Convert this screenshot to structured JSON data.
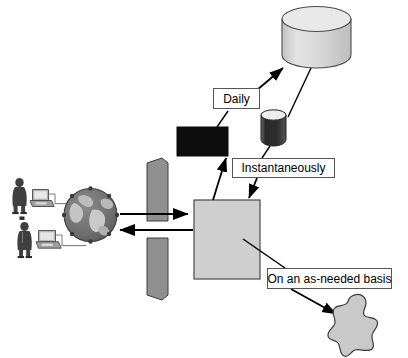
{
  "diagram": {
    "type": "flow-diagram",
    "background_color": "#ffffff",
    "labels": {
      "daily": "Daily",
      "instantaneously": "Instantaneously",
      "as_needed": "On an as-needed basis"
    },
    "nodes": [
      {
        "id": "user-top",
        "name": "user-person-top",
        "icon": "person-icon",
        "color": "#4a4a4a"
      },
      {
        "id": "workstation-top",
        "name": "workstation-top",
        "icon": "computer-icon",
        "color": "#9a9a9a"
      },
      {
        "id": "user-bottom",
        "name": "user-person-bottom",
        "icon": "person-icon",
        "color": "#4a4a4a"
      },
      {
        "id": "workstation-bottom",
        "name": "workstation-bottom",
        "icon": "computer-icon",
        "color": "#9a9a9a"
      },
      {
        "id": "globe",
        "name": "globe-internet",
        "icon": "globe-icon",
        "color": "#6e6e6e"
      },
      {
        "id": "firewall-top",
        "name": "firewall-barrier-top",
        "icon": "torn-paper-icon",
        "color": "#8c8c8c"
      },
      {
        "id": "firewall-bottom",
        "name": "firewall-barrier-bottom",
        "icon": "torn-paper-icon",
        "color": "#8c8c8c"
      },
      {
        "id": "server",
        "name": "server-square",
        "icon": "square-icon",
        "color": "#cccccc"
      },
      {
        "id": "black-box",
        "name": "black-rectangle-node",
        "icon": "rectangle-icon",
        "color": "#111111"
      },
      {
        "id": "warehouse",
        "name": "data-warehouse-cylinder",
        "icon": "database-cylinder-icon",
        "color": "#d2d2d2"
      },
      {
        "id": "small-db",
        "name": "small-database-cylinder",
        "icon": "database-cylinder-icon",
        "color": "#3b3b3b"
      },
      {
        "id": "blob",
        "name": "amoeba-blob-node",
        "icon": "blob-icon",
        "color": "#c9c9c9"
      }
    ],
    "connections": [
      {
        "from": "globe",
        "to": "server",
        "name": "arrow-globe-to-server",
        "direction": "right"
      },
      {
        "from": "server",
        "to": "globe",
        "name": "arrow-server-to-globe",
        "direction": "left"
      },
      {
        "from": "server",
        "to": "black-box",
        "name": "arrow-server-to-blackbox",
        "direction": "up"
      },
      {
        "from": "black-box",
        "to": "warehouse",
        "name": "arrow-blackbox-to-warehouse",
        "label": "Daily"
      },
      {
        "from": "warehouse",
        "to": "small-db",
        "name": "line-warehouse-to-smalldb"
      },
      {
        "from": "small-db",
        "to": "server",
        "name": "arrow-smalldb-to-server",
        "label": "Instantaneously"
      },
      {
        "from": "server",
        "to": "blob",
        "name": "arrow-server-to-blob",
        "label": "On an as-needed basis"
      }
    ]
  }
}
